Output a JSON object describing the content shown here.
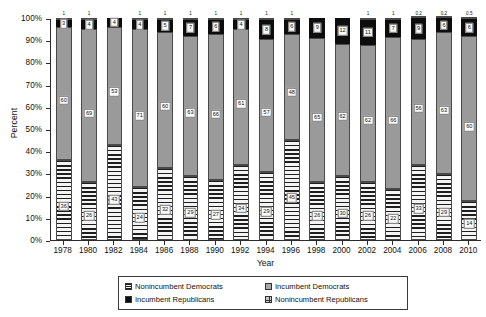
{
  "chart_data": {
    "type": "bar",
    "subtype": "stacked-100-percent-column",
    "title": "",
    "xlabel": "Year",
    "ylabel": "Percent",
    "ylim": [
      0,
      100
    ],
    "ytick_labels": [
      "0%",
      "10%",
      "20%",
      "30%",
      "40%",
      "50%",
      "60%",
      "70%",
      "80%",
      "90%",
      "100%"
    ],
    "ytick_values": [
      0,
      10,
      20,
      30,
      40,
      50,
      60,
      70,
      80,
      90,
      100
    ],
    "grid": false,
    "legend_position": "bottom",
    "categories": [
      1978,
      1980,
      1982,
      1984,
      1986,
      1988,
      1990,
      1992,
      1994,
      1996,
      1998,
      2000,
      2002,
      2004,
      2006,
      2008,
      2010
    ],
    "x_tick_labels": [
      "1978",
      "1980",
      "1982",
      "1984",
      "1986",
      "1988",
      "1990",
      "1992",
      "1994",
      "1996",
      "1998",
      "2000",
      "2002",
      "2004",
      "2006",
      "2008",
      "2010"
    ],
    "stack_order_bottom_to_top": [
      "Nonincumbent Democrats",
      "Incumbent Democrats",
      "Incumbent Republicans",
      "Nonincumbent Republicans"
    ],
    "series": [
      {
        "name": "Nonincumbent Democrats",
        "swatch": "sw-nd",
        "values": [
          36,
          26,
          43,
          24,
          32,
          29,
          27,
          34,
          29,
          45,
          26,
          30,
          26,
          22,
          33,
          29,
          14
        ],
        "labels": [
          "36",
          "26",
          "43",
          "24",
          "32",
          "29",
          "27",
          "34",
          "29",
          "45",
          "26",
          "30",
          "26",
          "22",
          "33",
          "29",
          "14"
        ]
      },
      {
        "name": "Incumbent Democrats",
        "swatch": "sw-id",
        "values": [
          60,
          69,
          53,
          71,
          60,
          63,
          66,
          61,
          57,
          48,
          65,
          62,
          62,
          66,
          56,
          63,
          60
        ],
        "labels": [
          "60",
          "69",
          "53",
          "71",
          "60",
          "63",
          "66",
          "61",
          "57",
          "48",
          "65",
          "62",
          "62",
          "66",
          "56",
          "63",
          "60"
        ]
      },
      {
        "name": "Incumbent Republicans",
        "swatch": "sw-ir",
        "values": [
          3,
          4,
          4,
          4,
          5,
          7,
          6,
          4,
          8,
          6,
          9,
          12,
          11,
          7,
          9,
          6,
          6
        ],
        "labels": [
          "3",
          "4",
          "4",
          "4",
          "5",
          "7",
          "6",
          "4",
          "8",
          "6",
          "9",
          "12",
          "11",
          "7",
          "9",
          "6",
          "6"
        ]
      },
      {
        "name": "Nonincumbent Republicans",
        "swatch": "sw-nr",
        "values": [
          1,
          1,
          0,
          1,
          1,
          1,
          1,
          1,
          1,
          1,
          0,
          0,
          1,
          1,
          0.2,
          0.2,
          0.5
        ],
        "labels": [
          "1",
          "1",
          "0",
          "1",
          "1",
          "1",
          "1",
          "1",
          "1",
          "1",
          "0",
          "0",
          "1",
          "1",
          "0.2",
          "0.2",
          "0.5"
        ]
      }
    ]
  },
  "legend": {
    "items": [
      {
        "label": "Nonincumbent Democrats",
        "swatch": "sw-nd"
      },
      {
        "label": "Incumbent Democrats",
        "swatch": "sw-id"
      },
      {
        "label": "Incumbent Republicans",
        "swatch": "sw-ir"
      },
      {
        "label": "Nonincumbent Republicans",
        "swatch": "sw-nr"
      }
    ]
  }
}
